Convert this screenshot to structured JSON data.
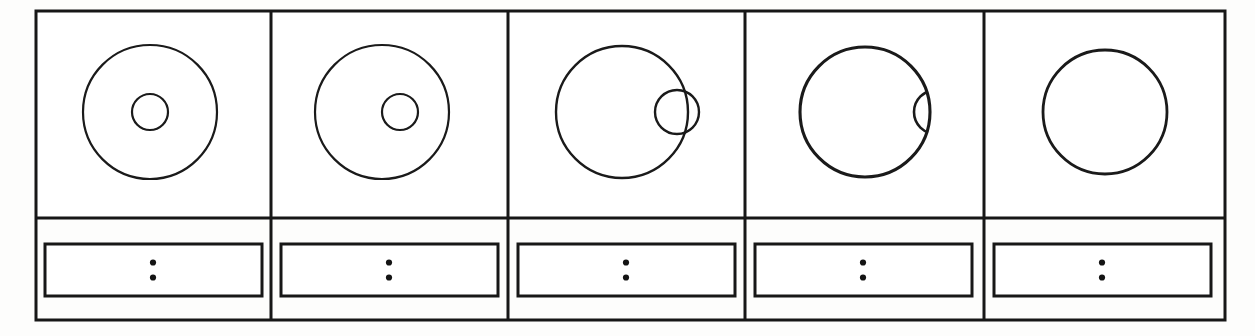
{
  "figure": {
    "kind": "technical-line-drawing",
    "panel_count": 5,
    "background_color": "#fdfdfc",
    "ink_color": "#171717",
    "outer_frame": {
      "x": 36,
      "y": 11,
      "width": 1189,
      "height": 309,
      "stroke_width": 3
    },
    "divider": {
      "horizontal_y": 218,
      "vertical_x": [
        271,
        508,
        745,
        984
      ],
      "stroke_width": 3
    },
    "label_box": {
      "height": 52,
      "top": 244,
      "stroke_width": 3,
      "mark": "vertical-colon",
      "dot_count": 2,
      "dot_radius": 3.1,
      "dot_gap": 15
    },
    "panels": [
      {
        "index": 1,
        "name": "panel-1",
        "cell": {
          "x": 36,
          "y": 11,
          "width": 235,
          "height": 207
        },
        "large_circle": {
          "cx": 150,
          "cy": 112,
          "r": 67,
          "stroke_width": 2.2
        },
        "small_circle": {
          "cx": 150,
          "cy": 112,
          "r": 18,
          "stroke_width": 2.2,
          "visible": true,
          "clip": "none"
        },
        "small_circle_offset": 0,
        "label_box": {
          "x": 45,
          "y": 244,
          "width": 217,
          "height": 52
        },
        "label_mark_cx": 153
      },
      {
        "index": 2,
        "name": "panel-2",
        "cell": {
          "x": 271,
          "y": 11,
          "width": 237,
          "height": 207
        },
        "large_circle": {
          "cx": 382,
          "cy": 112,
          "r": 67,
          "stroke_width": 2.2
        },
        "small_circle": {
          "cx": 400,
          "cy": 112,
          "r": 18,
          "stroke_width": 2.2,
          "visible": true,
          "clip": "none"
        },
        "small_circle_offset": 18,
        "label_box": {
          "x": 281,
          "y": 244,
          "width": 217,
          "height": 52
        },
        "label_mark_cx": 389
      },
      {
        "index": 3,
        "name": "panel-3",
        "cell": {
          "x": 508,
          "y": 11,
          "width": 237,
          "height": 207
        },
        "large_circle": {
          "cx": 622,
          "cy": 112,
          "r": 66,
          "stroke_width": 2.4
        },
        "small_circle": {
          "cx": 677,
          "cy": 112,
          "r": 22,
          "stroke_width": 2.4,
          "visible": true,
          "clip": "none"
        },
        "small_circle_offset": 55,
        "label_box": {
          "x": 518,
          "y": 244,
          "width": 217,
          "height": 52
        },
        "label_mark_cx": 626
      },
      {
        "index": 4,
        "name": "panel-4",
        "cell": {
          "x": 745,
          "y": 11,
          "width": 239,
          "height": 207
        },
        "large_circle": {
          "cx": 865,
          "cy": 112,
          "r": 65,
          "stroke_width": 3.1
        },
        "small_circle": {
          "cx": 936,
          "cy": 112,
          "r": 22,
          "stroke_width": 2.6,
          "visible": true,
          "clip": "inside-large"
        },
        "small_circle_offset": 71,
        "label_box": {
          "x": 755,
          "y": 244,
          "width": 217,
          "height": 52
        },
        "label_mark_cx": 863
      },
      {
        "index": 5,
        "name": "panel-5",
        "cell": {
          "x": 984,
          "y": 11,
          "width": 241,
          "height": 207
        },
        "large_circle": {
          "cx": 1105,
          "cy": 112,
          "r": 62,
          "stroke_width": 2.8
        },
        "small_circle": {
          "cx": 1105,
          "cy": 112,
          "r": 0,
          "stroke_width": 0,
          "visible": false,
          "clip": "none"
        },
        "small_circle_offset": null,
        "label_box": {
          "x": 994,
          "y": 244,
          "width": 217,
          "height": 52
        },
        "label_mark_cx": 1102
      }
    ]
  }
}
